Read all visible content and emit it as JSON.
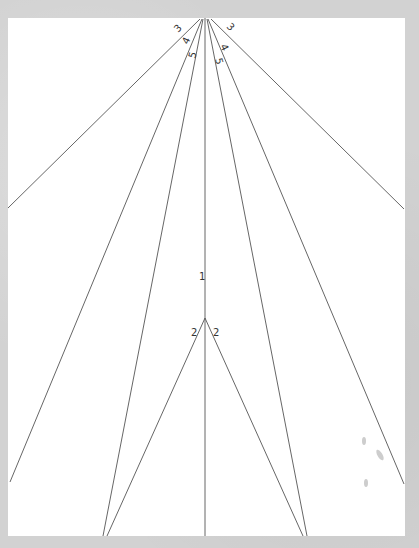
{
  "drawing": {
    "description": "Hand-drawn line diagram of converging lines (perspective/fan) on white paper",
    "apex": {
      "x": 205,
      "y": 18
    },
    "second_apex": {
      "x": 205,
      "y": 318
    },
    "lines": [
      {
        "id": "line-3-left",
        "label": "3",
        "x1": 200,
        "y1": 19,
        "x2": 8,
        "y2": 208
      },
      {
        "id": "line-3-right",
        "label": "3",
        "x1": 211,
        "y1": 19,
        "x2": 404,
        "y2": 209
      },
      {
        "id": "line-4-left",
        "label": "4",
        "x1": 202,
        "y1": 19,
        "x2": 10,
        "y2": 482
      },
      {
        "id": "line-4-right",
        "label": "4",
        "x1": 208,
        "y1": 19,
        "x2": 404,
        "y2": 484
      },
      {
        "id": "line-5-left",
        "label": "5",
        "x1": 203,
        "y1": 19,
        "x2": 103,
        "y2": 536
      },
      {
        "id": "line-5-right",
        "label": "5",
        "x1": 207,
        "y1": 19,
        "x2": 307,
        "y2": 536
      },
      {
        "id": "line-1-center",
        "label": "1",
        "x1": 205,
        "y1": 18,
        "x2": 205,
        "y2": 536
      },
      {
        "id": "line-2-left",
        "label": "2",
        "x1": 205,
        "y1": 318,
        "x2": 107,
        "y2": 536
      },
      {
        "id": "line-2-right",
        "label": "2",
        "x1": 205,
        "y1": 318,
        "x2": 303,
        "y2": 536
      }
    ],
    "labels": [
      {
        "text": "3",
        "x": 178,
        "y": 33,
        "rotate": -45
      },
      {
        "text": "3",
        "x": 226,
        "y": 27,
        "rotate": 45
      },
      {
        "text": "4",
        "x": 188,
        "y": 45,
        "rotate": -65
      },
      {
        "text": "4",
        "x": 220,
        "y": 46,
        "rotate": 65
      },
      {
        "text": "5",
        "x": 195,
        "y": 59,
        "rotate": -75
      },
      {
        "text": "5",
        "x": 215,
        "y": 59,
        "rotate": 75
      },
      {
        "text": "1",
        "x": 199,
        "y": 280,
        "rotate": 0
      },
      {
        "text": "2",
        "x": 191,
        "y": 336,
        "rotate": 0
      },
      {
        "text": "2",
        "x": 213,
        "y": 336,
        "rotate": 0
      }
    ]
  }
}
